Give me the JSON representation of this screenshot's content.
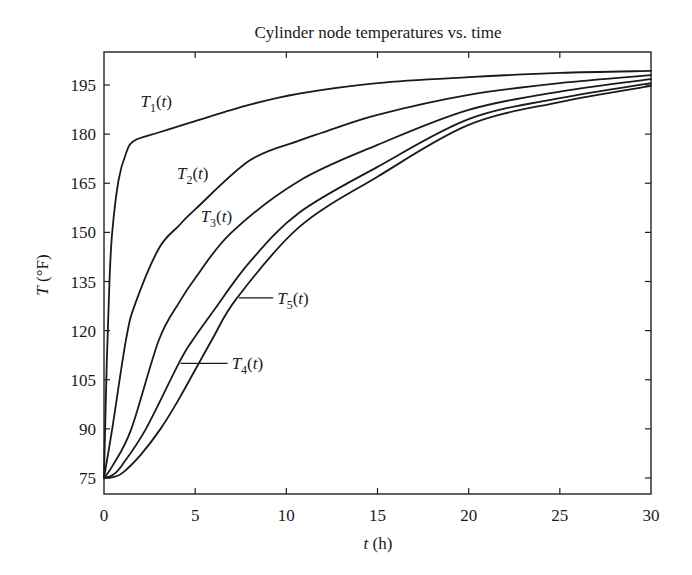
{
  "chart_data": {
    "type": "line",
    "title": "Cylinder node temperatures vs. time",
    "xlabel": "t (h)",
    "ylabel": "T (°F)",
    "xlim": [
      0,
      30
    ],
    "ylim": [
      70,
      201
    ],
    "xticks": [
      0,
      5,
      10,
      15,
      20,
      25,
      30
    ],
    "yticks": [
      75,
      90,
      105,
      120,
      135,
      150,
      165,
      180,
      195
    ],
    "grid": false,
    "legend": "inline labels",
    "series": [
      {
        "name": "T1(t)",
        "x": [
          0,
          0.15,
          0.3,
          0.45,
          0.8,
          1.2,
          1.65,
          3,
          5,
          8,
          10.7,
          15,
          20,
          25,
          30
        ],
        "y": [
          75,
          110,
          135,
          150,
          166,
          174,
          178,
          180.5,
          184,
          189,
          192.4,
          195.6,
          197.4,
          198.7,
          199.3
        ]
      },
      {
        "name": "T2(t)",
        "x": [
          0,
          0.45,
          1.2,
          1.7,
          3,
          4.1,
          5,
          8,
          10.7,
          12,
          15,
          20,
          25,
          30
        ],
        "y": [
          75,
          90,
          117,
          128,
          145,
          152,
          157,
          172,
          178,
          180.5,
          185.9,
          192,
          195.6,
          198
        ]
      },
      {
        "name": "T3(t)",
        "x": [
          0,
          0.5,
          1.5,
          3,
          4.1,
          5,
          7,
          10.7,
          15,
          20,
          25,
          30
        ],
        "y": [
          75,
          79,
          90,
          117,
          128.4,
          136,
          150,
          165.7,
          176.7,
          187.4,
          193,
          196.8
        ]
      },
      {
        "name": "T4(t)",
        "x": [
          0,
          0.5,
          1,
          2.3,
          4.1,
          4.85,
          6,
          8,
          10.7,
          15,
          20,
          25,
          30
        ],
        "y": [
          75,
          76,
          79,
          90,
          110,
          117,
          126,
          141,
          156,
          170,
          184.6,
          191,
          195.6
        ]
      },
      {
        "name": "T5(t)",
        "x": [
          0,
          0.5,
          1,
          2,
          3.1,
          4.1,
          5.9,
          7.3,
          10.7,
          15,
          20,
          25,
          30
        ],
        "y": [
          75,
          75.3,
          76.5,
          82,
          90,
          99,
          117,
          130,
          151.6,
          167,
          182.8,
          189.8,
          194.7
        ]
      }
    ],
    "annotations": [
      {
        "text": "T1(t)",
        "x": 2.0,
        "y": 190
      },
      {
        "text": "T2(t)",
        "x": 4.0,
        "y": 168
      },
      {
        "text": "T3(t)",
        "x": 5.3,
        "y": 155
      },
      {
        "text": "T4(t)",
        "x": 7.0,
        "y": 110,
        "leader_to_x": 4.2
      },
      {
        "text": "T5(t)",
        "x": 9.5,
        "y": 130,
        "leader_to_x": 7.4
      }
    ]
  },
  "labels": {
    "title": "Cylinder node temperatures vs. time",
    "xlabel_var": "t",
    "xlabel_unit": " (h)",
    "ylabel_var": "T",
    "ylabel_unit": " (°F)",
    "series": [
      {
        "main": "T",
        "sub": "1",
        "arg": "(t)"
      },
      {
        "main": "T",
        "sub": "2",
        "arg": "(t)"
      },
      {
        "main": "T",
        "sub": "3",
        "arg": "(t)"
      },
      {
        "main": "T",
        "sub": "4",
        "arg": "(t)"
      },
      {
        "main": "T",
        "sub": "5",
        "arg": "(t)"
      }
    ]
  }
}
